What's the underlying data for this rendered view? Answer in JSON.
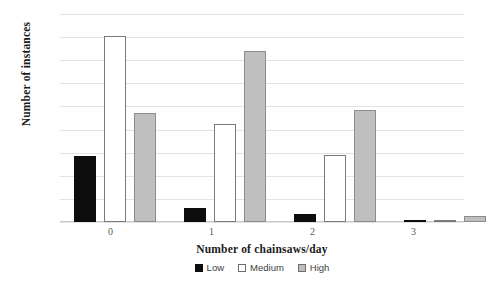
{
  "chart_data": {
    "type": "bar",
    "title": "",
    "xlabel": "Number of chainsaws/day",
    "ylabel": "Number of instances",
    "categories": [
      "0",
      "1",
      "2",
      "3"
    ],
    "series": [
      {
        "name": "Low",
        "color": "#0d0d0d",
        "values": [
          57,
          12,
          7,
          0
        ]
      },
      {
        "name": "Medium",
        "color": "#ffffff",
        "values": [
          161,
          85,
          58,
          1
        ]
      },
      {
        "name": "High",
        "color": "#bfbfbf",
        "values": [
          94,
          148,
          97,
          5
        ]
      }
    ],
    "ylim": [
      0,
      180
    ],
    "ytick_step": 20,
    "yticks": [
      0,
      20,
      40,
      60,
      80,
      100,
      120,
      140,
      160,
      180
    ],
    "ytick_labels": [
      "0",
      "20",
      "40",
      "60",
      "80",
      "100",
      "120",
      "140",
      "160",
      "180"
    ],
    "grid": "horizontal",
    "legend_position": "bottom",
    "legend_entries": [
      "Low",
      "Medium",
      "High"
    ]
  }
}
